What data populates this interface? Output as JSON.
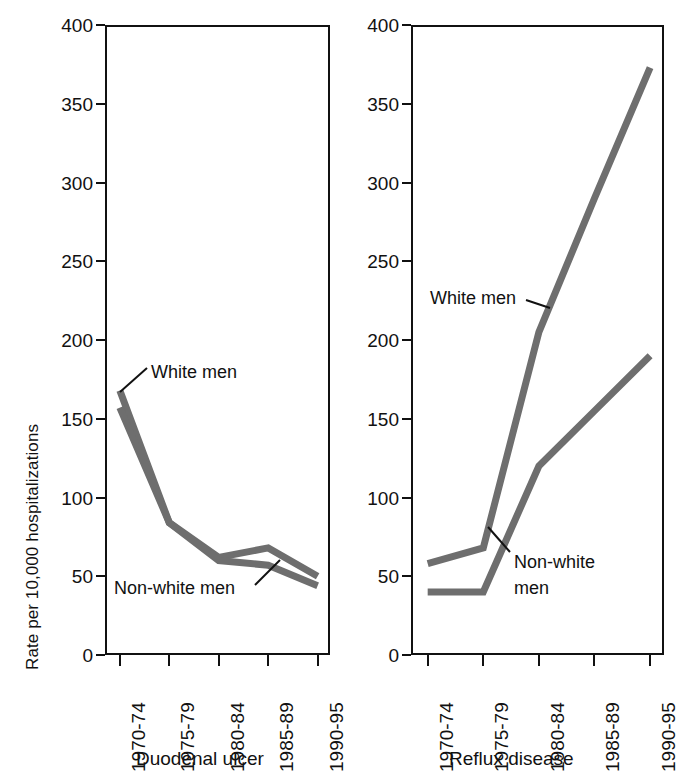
{
  "figure": {
    "y_axis_label": "Rate per 10,000 hospitalizations",
    "y_ticks": [
      "0",
      "50",
      "100",
      "150",
      "200",
      "250",
      "300",
      "350",
      "400"
    ],
    "x_categories": [
      "1970-74",
      "1975-79",
      "1980-84",
      "1985-89",
      "1990-95"
    ],
    "line_color": "#6e6e6e",
    "axis_color": "#111111"
  },
  "panels": [
    {
      "title": "Duodenal ulcer",
      "annotations": [
        {
          "id": "white-men",
          "text": "White men"
        },
        {
          "id": "non-white-men",
          "text": "Non-white men"
        }
      ]
    },
    {
      "title": "Reflux disease",
      "annotations": [
        {
          "id": "white-men",
          "text": "White men"
        },
        {
          "id": "non-white-men-line1",
          "text": "Non-white"
        },
        {
          "id": "non-white-men-line2",
          "text": "men"
        }
      ]
    }
  ],
  "chart_data": [
    {
      "type": "line",
      "title": "Duodenal ulcer",
      "xlabel": "",
      "ylabel": "Rate per 10,000 hospitalizations",
      "categories": [
        "1970-74",
        "1975-79",
        "1980-84",
        "1985-89",
        "1990-95"
      ],
      "ylim": [
        0,
        400
      ],
      "ytick_step": 50,
      "grid": false,
      "legend": "inline annotations",
      "series": [
        {
          "name": "White men",
          "values": [
            168,
            84,
            62,
            68,
            50
          ]
        },
        {
          "name": "Non-white men",
          "values": [
            157,
            84,
            60,
            57,
            44
          ]
        }
      ]
    },
    {
      "type": "line",
      "title": "Reflux disease",
      "xlabel": "",
      "ylabel": "Rate per 10,000 hospitalizations",
      "categories": [
        "1970-74",
        "1975-79",
        "1980-84",
        "1985-89",
        "1990-95"
      ],
      "ylim": [
        0,
        400
      ],
      "ytick_step": 50,
      "grid": false,
      "legend": "inline annotations",
      "note": "Right panel is clipped at the image edge; 1990-95 column is partially cut off.",
      "series": [
        {
          "name": "White men",
          "values": [
            58,
            68,
            205,
            290,
            373
          ]
        },
        {
          "name": "Non-white men",
          "values": [
            40,
            40,
            120,
            155,
            190
          ]
        }
      ]
    }
  ]
}
